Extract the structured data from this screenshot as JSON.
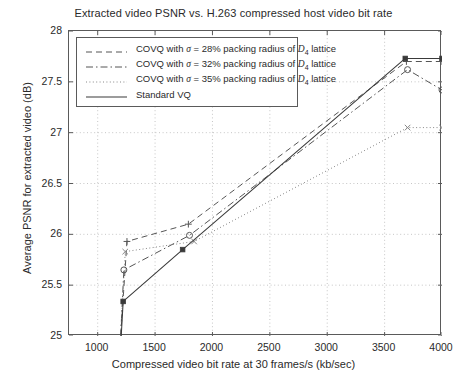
{
  "chart_data": {
    "type": "line",
    "title": "Extracted video PSNR vs. H.263 compressed host video bit rate",
    "xlabel": "Compressed video bit rate at 30 frames/s (kb/sec)",
    "ylabel": "Average PSNR for extracted video (dB)",
    "xlim": [
      750,
      4000
    ],
    "ylim": [
      25,
      28
    ],
    "xticks": [
      1000,
      1500,
      2000,
      2500,
      3000,
      3500,
      4000
    ],
    "yticks": [
      "25",
      "25.5",
      "26",
      "26.5",
      "27",
      "27.5",
      "28"
    ],
    "grid": true,
    "legend_position": "upper-left",
    "series": [
      {
        "name": "COVQ with σ = 28% packing radius of D4 lattice",
        "legend_label_prefix": "COVQ with ",
        "sigma": "σ",
        "legend_label_mid": " = 28% packing radius of ",
        "lattice": "D",
        "lattice_sub": "4",
        "legend_label_suffix": " lattice",
        "style": "dashed",
        "marker": "plus",
        "color": "#555555",
        "points": [
          {
            "x": 1200,
            "y": 25.0
          },
          {
            "x": 1255,
            "y": 25.93
          },
          {
            "x": 1790,
            "y": 26.1
          },
          {
            "x": 3690,
            "y": 27.7
          },
          {
            "x": 4000,
            "y": 27.7
          }
        ]
      },
      {
        "name": "COVQ with σ = 32% packing radius of D4 lattice",
        "legend_label_prefix": "COVQ with ",
        "sigma": "σ",
        "legend_label_mid": " = 32% packing radius of ",
        "lattice": "D",
        "lattice_sub": "4",
        "legend_label_suffix": " lattice",
        "style": "dashdot",
        "marker": "circle",
        "color": "#555555",
        "points": [
          {
            "x": 1200,
            "y": 25.0
          },
          {
            "x": 1228,
            "y": 25.65
          },
          {
            "x": 1800,
            "y": 25.99
          },
          {
            "x": 3700,
            "y": 27.62
          },
          {
            "x": 4000,
            "y": 27.42
          }
        ]
      },
      {
        "name": "COVQ with σ = 35% packing radius of D4 lattice",
        "legend_label_prefix": "COVQ with ",
        "sigma": "σ",
        "legend_label_mid": " = 35% packing radius of ",
        "lattice": "D",
        "lattice_sub": "4",
        "legend_label_suffix": " lattice",
        "style": "dotted",
        "marker": "cross",
        "color": "#888888",
        "points": [
          {
            "x": 1200,
            "y": 25.0
          },
          {
            "x": 1240,
            "y": 25.83
          },
          {
            "x": 1840,
            "y": 25.93
          },
          {
            "x": 3700,
            "y": 27.05
          },
          {
            "x": 4000,
            "y": 27.05
          }
        ]
      },
      {
        "name": "Standard VQ",
        "legend_label_prefix": "Standard VQ",
        "sigma": "",
        "legend_label_mid": "",
        "lattice": "",
        "lattice_sub": "",
        "legend_label_suffix": "",
        "style": "solid",
        "marker": "square",
        "color": "#3a3a3a",
        "points": [
          {
            "x": 1205,
            "y": 25.0
          },
          {
            "x": 1222,
            "y": 25.34
          },
          {
            "x": 1740,
            "y": 25.85
          },
          {
            "x": 3680,
            "y": 27.73
          },
          {
            "x": 4000,
            "y": 27.73
          }
        ]
      }
    ]
  },
  "legend": {
    "items": [
      {
        "label": "COVQ with σ = 28% packing radius of D4 lattice"
      },
      {
        "label": "COVQ with σ = 32% packing radius of D4 lattice"
      },
      {
        "label": "COVQ with σ = 35% packing radius of D4 lattice"
      },
      {
        "label": "Standard VQ"
      }
    ]
  }
}
